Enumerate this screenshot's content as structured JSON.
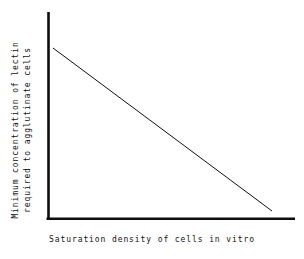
{
  "chart_data": {
    "type": "line",
    "title": "",
    "subtitle": "",
    "xlabel": "Saturation density of cells in vitro",
    "ylabel_line1": "Minimum concentration of lectin",
    "ylabel_line2": "required to agglutinate cells",
    "ylabel": "Minimum concentration of lectin required to agglutinate cells",
    "grid": false,
    "legend": false,
    "legend_position": "none",
    "axis_ticks": false,
    "tick_labels_x": [],
    "tick_labels_y": [],
    "xlim": [
      0,
      1
    ],
    "ylim": [
      0,
      1
    ],
    "annotations": [],
    "series": [
      {
        "name": "minimum agglutinating lectin concentration",
        "relationship": "linear decreasing",
        "x": [
          0.02,
          1.0
        ],
        "y": [
          1.0,
          0.02
        ],
        "points": [
          {
            "x": 0.02,
            "y": 1.0
          },
          {
            "x": 1.0,
            "y": 0.02
          }
        ],
        "color": "#111111",
        "line_width": 1
      }
    ],
    "colors": {
      "axis": "#0d0d0d",
      "data_line": "#111111",
      "background": "#ffffff",
      "text": "#111111"
    },
    "geometry": {
      "y_axis_x": 48,
      "y_axis_top": 12,
      "x_axis_y": 219,
      "x_axis_right": 295,
      "line_start_x": 53,
      "line_start_y": 48,
      "line_end_x": 272,
      "line_end_y": 211
    }
  }
}
